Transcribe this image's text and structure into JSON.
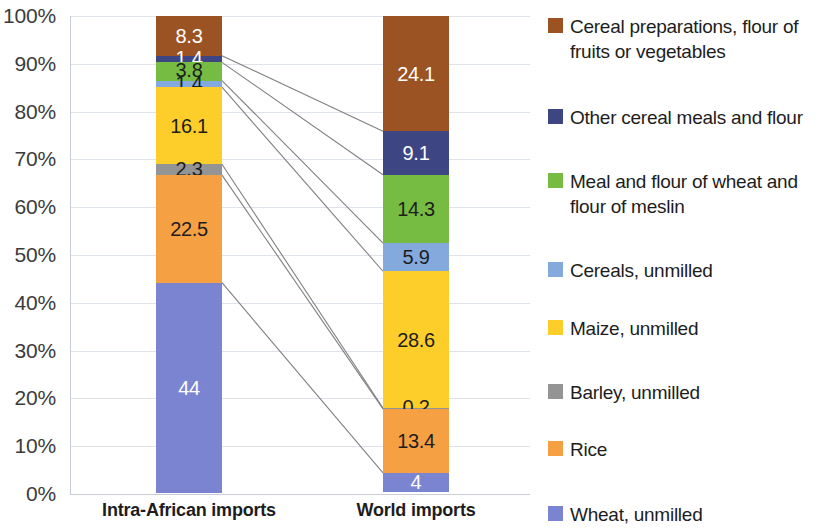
{
  "chart_data": {
    "type": "bar",
    "subtype": "100% stacked column with category connector lines",
    "title": "",
    "xlabel": "",
    "ylabel": "",
    "ylim": [
      0,
      100
    ],
    "grid": true,
    "legend_position": "right",
    "categories": [
      "Intra-African imports",
      "World imports"
    ],
    "ytick_labels": [
      "0%",
      "10%",
      "20%",
      "30%",
      "40%",
      "50%",
      "60%",
      "70%",
      "80%",
      "90%",
      "100%"
    ],
    "ytick_values": [
      0,
      10,
      20,
      30,
      40,
      50,
      60,
      70,
      80,
      90,
      100
    ],
    "stack_order_bottom_to_top": [
      "Wheat, unmilled",
      "Rice",
      "Barley, unmilled",
      "Maize, unmilled",
      "Cereals, unmilled",
      "Meal and flour of wheat and flour of meslin",
      "Other cereal meals and flour",
      "Cereal preparations, flour of fruits or vegetables"
    ],
    "series": [
      {
        "name": "Cereal preparations, flour of fruits or vegetables",
        "color": "#9c5323",
        "values": [
          8.3,
          24.1
        ],
        "labels": [
          "8.3",
          "24.1"
        ],
        "label_color": [
          "light",
          "light"
        ]
      },
      {
        "name": "Other cereal meals and flour",
        "color": "#3d4583",
        "values": [
          1.4,
          9.1
        ],
        "labels": [
          "1.4",
          "9.1"
        ],
        "label_color": [
          "light",
          "light"
        ]
      },
      {
        "name": "Meal and flour of wheat and flour of meslin",
        "color": "#77bc42",
        "values": [
          3.8,
          14.3
        ],
        "labels": [
          "3.8",
          "14.3"
        ],
        "label_color": [
          "dark",
          "dark"
        ]
      },
      {
        "name": "Cereals, unmilled",
        "color": "#84a9dd",
        "values": [
          1.4,
          5.9
        ],
        "labels": [
          "1.4",
          "5.9"
        ],
        "label_color": [
          "dark",
          "dark"
        ]
      },
      {
        "name": "Maize, unmilled",
        "color": "#fdce2a",
        "values": [
          16.1,
          28.6
        ],
        "labels": [
          "16.1",
          "28.6"
        ],
        "label_color": [
          "dark",
          "dark"
        ]
      },
      {
        "name": "Barley, unmilled",
        "color": "#949494",
        "values": [
          2.3,
          0.2
        ],
        "labels": [
          "2.3",
          "0.2"
        ],
        "label_color": [
          "dark",
          "dark"
        ]
      },
      {
        "name": "Rice",
        "color": "#f6a044",
        "values": [
          22.5,
          13.4
        ],
        "labels": [
          "22.5",
          "13.4"
        ],
        "label_color": [
          "dark",
          "dark"
        ]
      },
      {
        "name": "Wheat, unmilled",
        "color": "#7b84d0",
        "values": [
          44.0,
          4.0
        ],
        "labels": [
          "44",
          "4"
        ],
        "label_color": [
          "light",
          "light"
        ]
      }
    ]
  },
  "legend": {
    "items": [
      {
        "label": "Cereal preparations, flour of fruits or vegetables",
        "color": "#9c5323"
      },
      {
        "label": "Other cereal meals and flour",
        "color": "#3d4583"
      },
      {
        "label": "Meal and flour of wheat and flour of meslin",
        "color": "#77bc42"
      },
      {
        "label": "Cereals, unmilled",
        "color": "#84a9dd"
      },
      {
        "label": "Maize, unmilled",
        "color": "#fdce2a"
      },
      {
        "label": "Barley, unmilled",
        "color": "#949494"
      },
      {
        "label": "Rice",
        "color": "#f6a044"
      },
      {
        "label": "Wheat, unmilled",
        "color": "#7b84d0"
      }
    ]
  },
  "axis": {
    "gridline_color": "#dfe3ea",
    "axis_color": "#c9ced6",
    "connector_color": "#808080"
  }
}
